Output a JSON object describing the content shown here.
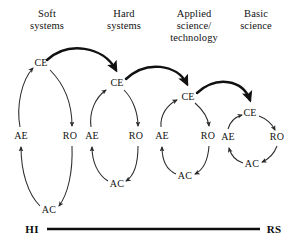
{
  "figure": {
    "background_color": "#ffffff",
    "ink_color": "#1a1a1a",
    "thin_stroke_color": "#2b2b2b",
    "thick_stroke_color": "#111111"
  },
  "columns": [
    {
      "id": "soft-systems",
      "title": "Soft\nsystems",
      "title_x": 47,
      "title_y": 8
    },
    {
      "id": "hard-systems",
      "title": "Hard\nsystems",
      "title_x": 124,
      "title_y": 8
    },
    {
      "id": "applied-science",
      "title": "Applied\nscience/\ntechnology",
      "title_x": 194,
      "title_y": 8
    },
    {
      "id": "basic-science",
      "title": "Basic\nscience",
      "title_x": 256,
      "title_y": 8
    }
  ],
  "cycles": [
    {
      "id": "cycle-soft-systems",
      "column": "soft-systems",
      "nodes": [
        {
          "code": "CE",
          "name": "concrete-experience",
          "x": 41,
          "y": 63
        },
        {
          "code": "RO",
          "name": "reflective-observation",
          "x": 70,
          "y": 136
        },
        {
          "code": "AC",
          "name": "abstract-conceptualization",
          "x": 49,
          "y": 210
        },
        {
          "code": "AE",
          "name": "active-experimentation",
          "x": 21,
          "y": 136
        }
      ]
    },
    {
      "id": "cycle-hard-systems",
      "column": "hard-systems",
      "nodes": [
        {
          "code": "CE",
          "name": "concrete-experience",
          "x": 117,
          "y": 83
        },
        {
          "code": "RO",
          "name": "reflective-observation",
          "x": 136,
          "y": 136
        },
        {
          "code": "AC",
          "name": "abstract-conceptualization",
          "x": 117,
          "y": 184
        },
        {
          "code": "AE",
          "name": "active-experimentation",
          "x": 92,
          "y": 136
        }
      ]
    },
    {
      "id": "cycle-applied-science",
      "column": "applied-science",
      "nodes": [
        {
          "code": "CE",
          "name": "concrete-experience",
          "x": 188,
          "y": 97
        },
        {
          "code": "RO",
          "name": "reflective-observation",
          "x": 208,
          "y": 136
        },
        {
          "code": "AC",
          "name": "abstract-conceptualization",
          "x": 185,
          "y": 176
        },
        {
          "code": "AE",
          "name": "active-experimentation",
          "x": 162,
          "y": 136
        }
      ]
    },
    {
      "id": "cycle-basic-science",
      "column": "basic-science",
      "nodes": [
        {
          "code": "CE",
          "name": "concrete-experience",
          "x": 250,
          "y": 113
        },
        {
          "code": "RO",
          "name": "reflective-observation",
          "x": 277,
          "y": 137
        },
        {
          "code": "AC",
          "name": "abstract-conceptualization",
          "x": 252,
          "y": 164
        },
        {
          "code": "AE",
          "name": "active-experimentation",
          "x": 228,
          "y": 137
        }
      ]
    }
  ],
  "transitions": [
    {
      "id": "soft-to-hard",
      "from": "cycle-soft-systems",
      "to": "cycle-hard-systems"
    },
    {
      "id": "hard-to-applied",
      "from": "cycle-hard-systems",
      "to": "cycle-applied-science"
    },
    {
      "id": "applied-to-basic",
      "from": "cycle-applied-science",
      "to": "cycle-basic-science"
    }
  ],
  "axis": {
    "name": "holism-reductionism-axis",
    "left_label": "HI",
    "right_label": "RS",
    "left_label_x": 32,
    "right_label_x": 274,
    "y": 229,
    "line_x1": 47,
    "line_x2": 260
  }
}
